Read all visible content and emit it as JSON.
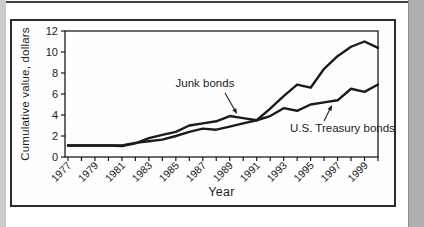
{
  "page": {
    "top_rule_color": "#414141",
    "left_strip_color": "#cccccc",
    "right_strip_color": "#aeaeae",
    "line_color": "#1b1b1b",
    "text_color": "#222222"
  },
  "chart_data": {
    "type": "line",
    "x": [
      1977,
      1978,
      1979,
      1980,
      1981,
      1982,
      1983,
      1984,
      1985,
      1986,
      1987,
      1988,
      1989,
      1990,
      1991,
      1992,
      1993,
      1994,
      1995,
      1996,
      1997,
      1998,
      1999,
      2000
    ],
    "series": [
      {
        "name": "Junk bonds",
        "values": [
          1.1,
          1.1,
          1.1,
          1.1,
          1.05,
          1.3,
          1.8,
          2.1,
          2.4,
          3.0,
          3.2,
          3.4,
          3.9,
          3.7,
          3.5,
          4.6,
          5.8,
          6.9,
          6.6,
          8.4,
          9.6,
          10.5,
          11.0,
          10.4
        ]
      },
      {
        "name": "U.S. Treasury bonds",
        "values": [
          1.1,
          1.1,
          1.1,
          1.1,
          1.1,
          1.35,
          1.5,
          1.65,
          2.0,
          2.4,
          2.7,
          2.6,
          2.9,
          3.2,
          3.5,
          3.9,
          4.65,
          4.4,
          5.0,
          5.2,
          5.4,
          6.5,
          6.2,
          6.9
        ]
      }
    ],
    "title": "",
    "xlabel": "Year",
    "ylabel": "Cumulative value, dollars",
    "ylim": [
      0,
      12
    ],
    "yticks": [
      0,
      2,
      4,
      6,
      8,
      10,
      12
    ],
    "xtick_labels": [
      "1977",
      "1979",
      "1981",
      "1983",
      "1985",
      "1987",
      "1989",
      "1991",
      "1993",
      "1995",
      "1997",
      "1999"
    ],
    "grid": false,
    "legend_position": "none",
    "annotations": [
      {
        "text": "Junk bonds",
        "target_year": 1989,
        "target_value": 3.9
      },
      {
        "text": "U.S. Treasury bonds",
        "target_year": 1997,
        "target_value": 5.3
      }
    ]
  }
}
